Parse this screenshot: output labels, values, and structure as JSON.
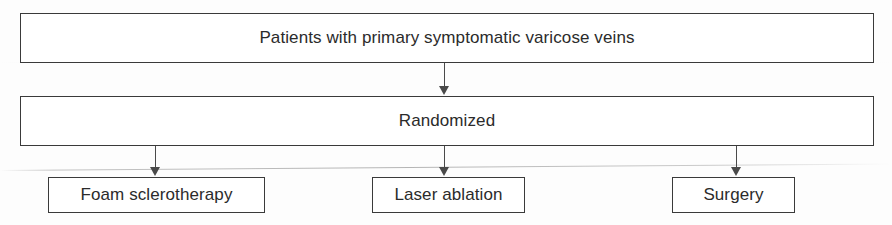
{
  "diagram": {
    "type": "flowchart",
    "nodes": {
      "patients": {
        "label": "Patients with primary symptomatic varicose veins",
        "role": "population"
      },
      "randomized": {
        "label": "Randomized",
        "role": "allocation"
      },
      "foam": {
        "label": "Foam sclerotherapy",
        "role": "treatment-arm"
      },
      "laser": {
        "label": "Laser ablation",
        "role": "treatment-arm"
      },
      "surgery": {
        "label": "Surgery",
        "role": "treatment-arm"
      }
    },
    "edges": [
      {
        "from": "patients",
        "to": "randomized",
        "marker": "arrow"
      },
      {
        "from": "randomized",
        "to": "foam",
        "marker": "arrow"
      },
      {
        "from": "randomized",
        "to": "laser",
        "marker": "arrow"
      },
      {
        "from": "randomized",
        "to": "surgery",
        "marker": "arrow"
      }
    ],
    "colors": {
      "box_border": "#3a3a3a",
      "box_fill": "#ffffff",
      "text": "#2b2b2b",
      "connector": "#4a4a4a",
      "background": "#fdfdfd"
    }
  }
}
